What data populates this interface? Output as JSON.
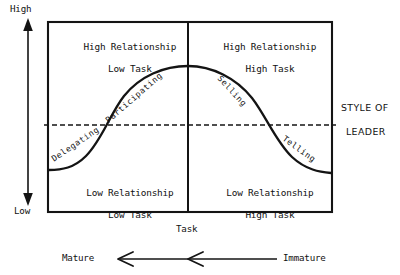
{
  "diagram": {
    "title_side": {
      "line1": "STYLE OF",
      "line2": "LEADER"
    },
    "y_axis": {
      "high": "High",
      "low": "Low"
    },
    "x_axis": {
      "label": "Task"
    },
    "maturity_axis": {
      "left": "Mature",
      "right": "Immature"
    },
    "quadrants": [
      {
        "id": "top-left",
        "line1": "High Relationship",
        "line2": "Low Task"
      },
      {
        "id": "top-right",
        "line1": "High Relationship",
        "line2": "High Task"
      },
      {
        "id": "bottom-left",
        "line1": "Low Relationship",
        "line2": "Low Task"
      },
      {
        "id": "bottom-right",
        "line1": "Low Relationship",
        "line2": "High Task"
      }
    ],
    "curve_labels": [
      {
        "id": "delegating",
        "text": "Delegating"
      },
      {
        "id": "participating",
        "text": "Participating"
      },
      {
        "id": "selling",
        "text": "Selling"
      },
      {
        "id": "telling",
        "text": "Telling"
      }
    ],
    "colors": {
      "ink": "#141414",
      "paper": "#ffffff"
    }
  }
}
